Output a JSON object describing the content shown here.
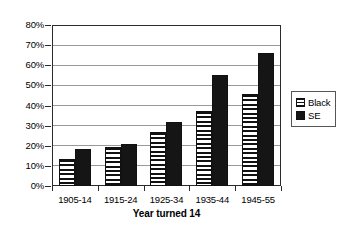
{
  "chart_data": {
    "type": "bar",
    "title": "",
    "subtitle": "",
    "xlabel": "Year turned 14",
    "ylabel": "",
    "categories": [
      "1905-14",
      "1915-24",
      "1925-34",
      "1935-44",
      "1945-55"
    ],
    "series": [
      {
        "name": "Black",
        "values": [
          13.5,
          19.5,
          27,
          37.5,
          45.5
        ],
        "pattern": "horizontal-stripes",
        "color": "#ffffff"
      },
      {
        "name": "SE",
        "values": [
          18.5,
          21,
          32,
          55,
          66
        ],
        "pattern": "solid",
        "color": "#151515"
      }
    ],
    "ylim": [
      0,
      80
    ],
    "ytick_values": [
      0,
      10,
      20,
      30,
      40,
      50,
      60,
      70,
      80
    ],
    "ytick_labels": [
      "0%",
      "10%",
      "20%",
      "30%",
      "40%",
      "50%",
      "60%",
      "70%",
      "80%"
    ],
    "value_suffix": "%",
    "grid": true,
    "grid_axis": "y",
    "legend_position": "right",
    "legend_entries": [
      "Black",
      "SE"
    ],
    "annotations": []
  },
  "legend": {
    "items": [
      {
        "label": "Black",
        "swatch_name": "legend-swatch-black"
      },
      {
        "label": "SE",
        "swatch_name": "legend-swatch-se"
      }
    ]
  },
  "axis": {
    "x_title": "Year turned 14"
  },
  "colors": {
    "frame": "#2b2b2b",
    "gridline": "#9a9a9a",
    "bar_se": "#151515",
    "bar_black_fill": "#ffffff",
    "background": "#ffffff"
  }
}
